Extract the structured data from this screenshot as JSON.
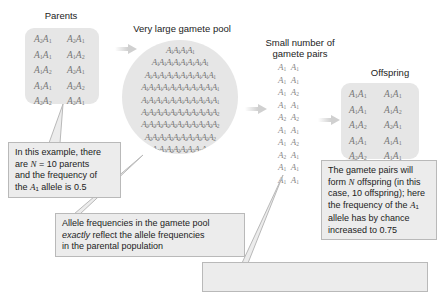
{
  "titles": {
    "parents": "Parents",
    "gamete_pool": "Very large gamete pool",
    "gamete_pairs_line1": "Small number of",
    "gamete_pairs_line2": "gamete pairs",
    "offspring": "Offspring"
  },
  "parents": [
    [
      "A2A1",
      "A2A1"
    ],
    [
      "A1A1",
      "A1A2"
    ],
    [
      "A1A2",
      "A2A1"
    ],
    [
      "A1A1",
      "A2A2"
    ],
    [
      "A2A2",
      "A2A1"
    ]
  ],
  "gamete_pool_rows": [
    {
      "allele": "1",
      "count": 4
    },
    {
      "allele": "1",
      "count": 8
    },
    {
      "allele": "1",
      "count": 10
    },
    {
      "allele": "1",
      "count": 11
    },
    {
      "allele": "1",
      "count": 11
    },
    {
      "allele": "2",
      "count": 11
    },
    {
      "allele": "2",
      "count": 11
    },
    {
      "allele": "2",
      "count": 10
    },
    {
      "allele": "2",
      "count": 8
    },
    {
      "allele": "2",
      "count": 4
    }
  ],
  "gamete_pairs": [
    "A1A1",
    "A1A1",
    "A1A2",
    "A1A1",
    "A2A2",
    "A1A1",
    "A1A2",
    "A2A1",
    "A1A1",
    "A1A1"
  ],
  "offspring": [
    [
      "A1A1",
      "A1A1"
    ],
    [
      "A1A1",
      "A1A2"
    ],
    [
      "A1A2",
      "A2A1"
    ],
    [
      "A1A1",
      "A1A1"
    ],
    [
      "A2A2",
      "A1A1"
    ]
  ],
  "callouts": {
    "parents": {
      "line1": "In this example, there",
      "line2_pre": "are ",
      "line2_var": "N",
      "line2_post": " = 10 parents",
      "line3": "and the frequency of",
      "line4_pre": "the ",
      "line4_allele": "A",
      "line4_sub": "1",
      "line4_post": " allele is 0.5"
    },
    "pool": {
      "line1": "Allele frequencies in the gamete pool",
      "line2_em": "exactly",
      "line2_post": " reflect the allele frequencies",
      "line3": "in the parental population"
    },
    "offspring": {
      "line1": "The gamete pairs will",
      "line2_pre": "form ",
      "line2_var": "N",
      "line2_post": " offspring (in this",
      "line3": "case, 10 offspring); here",
      "line4_pre": "the frequency of the ",
      "line4_allele": "A",
      "line4_sub": "1",
      "line5": "allele has by chance",
      "line6": "increased to 0.75"
    }
  },
  "colors": {
    "panel_bg": "#e6e6e6",
    "callout_bg": "#ececec",
    "callout_border": "#b9b9b9",
    "genotype_text": "#777777",
    "arrow": "#d0d0d0"
  }
}
